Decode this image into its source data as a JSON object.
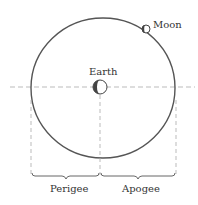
{
  "diagram": {
    "labels": {
      "moon": "Moon",
      "earth": "Earth",
      "perigee": "Perigee",
      "apogee": "Apogee"
    },
    "colors": {
      "orbit": "#555555",
      "dashed": "#aaaaaa",
      "text": "#333333",
      "shadow": "#444444"
    }
  }
}
